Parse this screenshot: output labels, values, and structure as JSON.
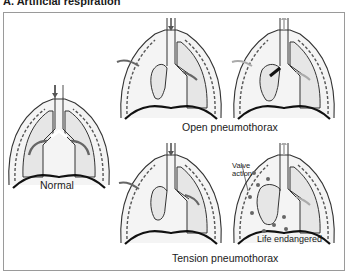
{
  "figure": {
    "title": "A. Artificial respiration",
    "panels": [
      {
        "id": "normal",
        "caption": "Normal"
      },
      {
        "id": "open-inhale"
      },
      {
        "id": "open-exhale"
      },
      {
        "id": "tension-inhale"
      },
      {
        "id": "tension-exhale"
      }
    ],
    "group_labels": {
      "open": "Open pneumothorax",
      "tension": "Tension pneumothorax"
    },
    "annotations": {
      "valve": "Valve\naction",
      "valve_line1": "Valve",
      "valve_line2": "action",
      "danger": "Life endangered"
    },
    "colors": {
      "outline": "#333333",
      "lung_fill": "#e6e6e6",
      "pleura_fill": "#f2f2f2",
      "arrow_dark": "#555555",
      "arrow_light": "#aaaaaa",
      "frame": "#9a9a9a"
    }
  }
}
